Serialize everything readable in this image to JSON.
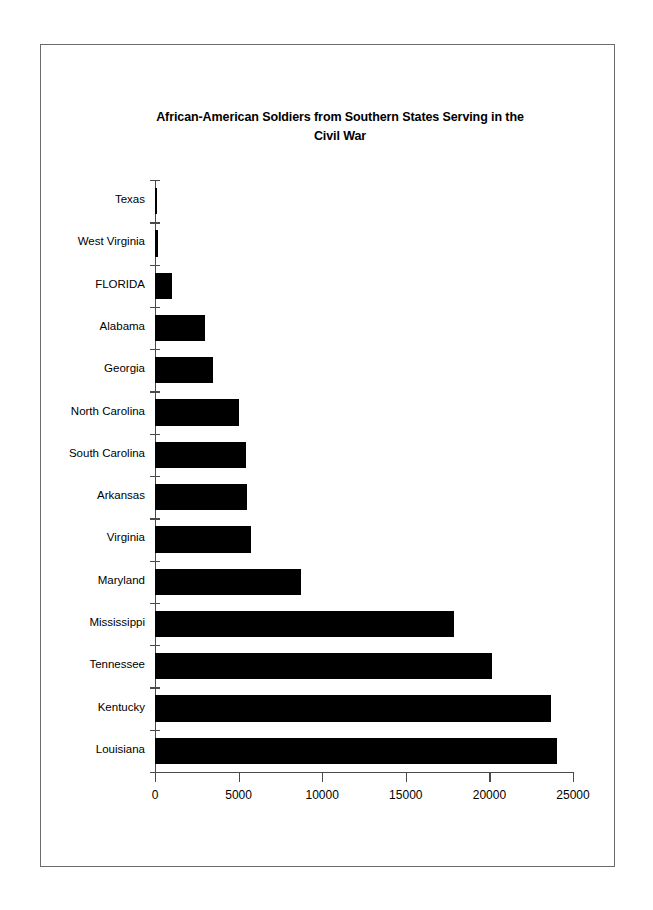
{
  "chart_data": {
    "type": "bar",
    "orientation": "horizontal",
    "title": "African-American Soldiers from Southern States Serving in the Civil War",
    "title_line1": "African-American Soldiers from Southern States Serving in the",
    "title_line2": "Civil War",
    "xlabel": "",
    "ylabel": "",
    "categories": [
      "Texas",
      "West Virginia",
      "FLORIDA",
      "Alabama",
      "Georgia",
      "North Carolina",
      "South Carolina",
      "Arkansas",
      "Virginia",
      "Maryland",
      "Mississippi",
      "Tennessee",
      "Kentucky",
      "Louisiana"
    ],
    "values": [
      47,
      196,
      1044,
      2969,
      3486,
      5035,
      5462,
      5526,
      5723,
      8718,
      17869,
      20133,
      23703,
      24052
    ],
    "xlim": [
      0,
      25000
    ],
    "xticks": [
      0,
      5000,
      10000,
      15000,
      20000,
      25000
    ],
    "xtick_labels": [
      "0",
      "5000",
      "10000",
      "15000",
      "20000",
      "25000"
    ],
    "grid": false,
    "legend": false,
    "bar_color": "#000000",
    "axis_color": "#4a4a4a",
    "background_color": "#ffffff"
  },
  "frame": {
    "border_color": "#6b6b6b"
  }
}
